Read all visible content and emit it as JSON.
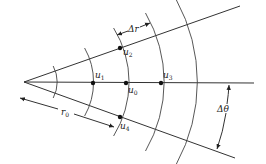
{
  "diagram": {
    "origin": {
      "x": 24,
      "y": 82
    },
    "rays": [
      {
        "name": "upper-ray",
        "to": {
          "x": 240,
          "y": 6
        }
      },
      {
        "name": "center-ray",
        "to": {
          "x": 254,
          "y": 83
        }
      },
      {
        "name": "lower-ray",
        "to": {
          "x": 235,
          "y": 158
        }
      }
    ],
    "arc_radii": [
      34,
      69,
      102,
      137,
      171
    ],
    "nodes": [
      {
        "id": "u0",
        "label": "u",
        "sub": "0",
        "x": 126,
        "y": 83
      },
      {
        "id": "u1",
        "label": "u",
        "sub": "1",
        "x": 93,
        "y": 83
      },
      {
        "id": "u2",
        "label": "u",
        "sub": "2",
        "x": 120,
        "y": 48
      },
      {
        "id": "u3",
        "label": "u",
        "sub": "3",
        "x": 161,
        "y": 83
      },
      {
        "id": "u4",
        "label": "u",
        "sub": "4",
        "x": 120,
        "y": 117
      }
    ],
    "labels": {
      "delta_r": "Δr",
      "r0": "r",
      "r0_sub": "0",
      "delta_theta": "Δθ"
    },
    "colors": {
      "line": "#333333",
      "node": "#111111",
      "background": "#ffffff"
    }
  }
}
